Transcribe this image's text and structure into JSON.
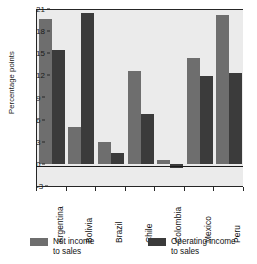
{
  "chart_data": {
    "type": "bar",
    "title": "",
    "xlabel": "",
    "ylabel": "Percentage points",
    "ylim": [
      -3,
      21
    ],
    "yticks": [
      21,
      18,
      15,
      12,
      9,
      6,
      3,
      0,
      -3
    ],
    "grid": false,
    "legend_position": "bottom",
    "categories": [
      "Argentina",
      "Bolivia",
      "Brazil",
      "Chile",
      "Colombia",
      "Mexico",
      "Peru"
    ],
    "series": [
      {
        "name": "Net income to sales",
        "color": "#6e6e6e",
        "values": [
          19.7,
          5.0,
          2.9,
          12.6,
          0.5,
          14.4,
          20.2
        ]
      },
      {
        "name": "Operating income to sales",
        "color": "#3b3b3b",
        "values": [
          15.4,
          20.5,
          1.5,
          6.7,
          -0.6,
          11.9,
          12.3
        ]
      }
    ]
  },
  "axis": {
    "y_title": "Percentage points",
    "y_tick_labels": [
      "21",
      "18",
      "15",
      "12",
      "9",
      "6",
      "3",
      "0",
      "-3"
    ],
    "x_tick_labels": [
      "Argentina",
      "Bolivia",
      "Brazil",
      "Chile",
      "Colombia",
      "Mexico",
      "Peru"
    ]
  },
  "legend": {
    "items": [
      {
        "label_line1": "Net income",
        "label_line2": "to sales",
        "color": "#6e6e6e"
      },
      {
        "label_line1": "Operating income",
        "label_line2": "to sales",
        "color": "#3b3b3b"
      }
    ]
  },
  "colors": {
    "plot_background": "#ebebeb",
    "page_background": "#ffffff",
    "axis": "#262626",
    "net_income": "#6e6e6e",
    "operating_income": "#3b3b3b"
  }
}
